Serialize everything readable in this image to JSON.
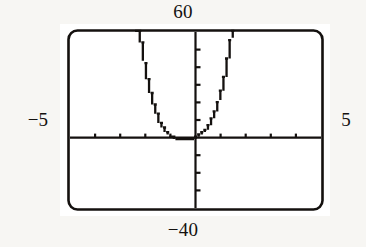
{
  "figure": {
    "kind": "graphing-calculator-screen",
    "labels": {
      "ymax": "60",
      "ymin": "−40",
      "xmin": "−5",
      "xmax": "5"
    },
    "colors": {
      "ink": "#14110f",
      "paper": "#f7f6f3",
      "screen": "#ffffff"
    }
  },
  "chart_data": {
    "type": "line",
    "title": "",
    "xlabel": "",
    "ylabel": "",
    "xlim": [
      -5,
      5
    ],
    "ylim": [
      -40,
      60
    ],
    "grid": false,
    "legend": null,
    "axes": {
      "x_axis_visible": true,
      "y_axis_visible": true,
      "x_tick_step": 1,
      "y_tick_step": 10,
      "x_ticks": [
        -5,
        -4,
        -3,
        -2,
        -1,
        0,
        1,
        2,
        3,
        4,
        5
      ],
      "y_ticks": [
        -40,
        -30,
        -20,
        -10,
        0,
        10,
        20,
        30,
        40,
        50,
        60
      ]
    },
    "annotations": [
      "Window: Xmin=-5, Xmax=5, Ymin=-40, Ymax=60",
      "Upward-opening parabola-like curve with vertex just below the x-axis near x = -0.5",
      "Left branch rises off the top of the screen near x = -2.3",
      "Right branch rises off the top of the screen near x = 1.3"
    ],
    "series": [
      {
        "name": "curve",
        "x": [
          -2.4,
          -2.3,
          -2.2,
          -2.1,
          -2.0,
          -1.9,
          -1.8,
          -1.7,
          -1.6,
          -1.5,
          -1.4,
          -1.3,
          -1.2,
          -1.1,
          -1.0,
          -0.9,
          -0.8,
          -0.7,
          -0.6,
          -0.5,
          -0.4,
          -0.3,
          -0.2,
          -0.1,
          0.0,
          0.1,
          0.2,
          0.3,
          0.4,
          0.5,
          0.6,
          0.7,
          0.8,
          0.9,
          1.0,
          1.1,
          1.2,
          1.3,
          1.4
        ],
        "y": [
          74.0,
          62.0,
          52.0,
          43.0,
          35.0,
          28.5,
          22.5,
          17.5,
          13.0,
          9.5,
          6.5,
          4.0,
          2.2,
          1.0,
          0.2,
          -0.4,
          -0.8,
          -1.0,
          -1.1,
          -1.1,
          -1.0,
          -0.8,
          -0.5,
          -0.2,
          0.4,
          1.2,
          2.2,
          3.6,
          5.4,
          7.6,
          10.4,
          13.6,
          17.6,
          22.2,
          27.6,
          34.0,
          41.4,
          50.0,
          60.0
        ]
      }
    ]
  }
}
